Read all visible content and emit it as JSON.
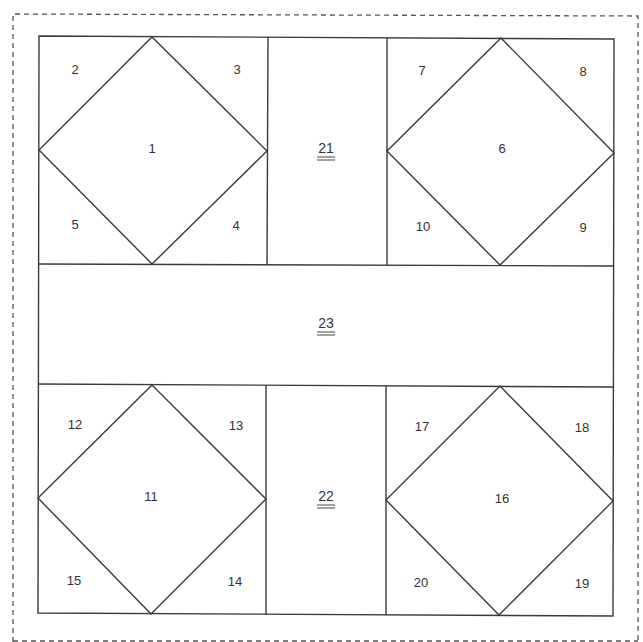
{
  "diagram": {
    "type": "quilt-block-pattern",
    "colors": {
      "line": "#3a3a3a",
      "label": "#333333",
      "dashed_border": "#555555",
      "background": "#ffffff"
    },
    "outer_border_style": "dashed",
    "pieces": [
      {
        "id": "1",
        "label": "1",
        "shape": "diamond",
        "block": "upper-left"
      },
      {
        "id": "2",
        "label": "2",
        "shape": "triangle",
        "block": "upper-left",
        "corner": "top-left"
      },
      {
        "id": "3",
        "label": "3",
        "shape": "triangle",
        "block": "upper-left",
        "corner": "top-right"
      },
      {
        "id": "4",
        "label": "4",
        "shape": "triangle",
        "block": "upper-left",
        "corner": "bottom-right"
      },
      {
        "id": "5",
        "label": "5",
        "shape": "triangle",
        "block": "upper-left",
        "corner": "bottom-left"
      },
      {
        "id": "6",
        "label": "6",
        "shape": "diamond",
        "block": "upper-right"
      },
      {
        "id": "7",
        "label": "7",
        "shape": "triangle",
        "block": "upper-right",
        "corner": "top-left"
      },
      {
        "id": "8",
        "label": "8",
        "shape": "triangle",
        "block": "upper-right",
        "corner": "top-right"
      },
      {
        "id": "9",
        "label": "9",
        "shape": "triangle",
        "block": "upper-right",
        "corner": "bottom-right"
      },
      {
        "id": "10",
        "label": "10",
        "shape": "triangle",
        "block": "upper-right",
        "corner": "bottom-left"
      },
      {
        "id": "11",
        "label": "11",
        "shape": "diamond",
        "block": "lower-left"
      },
      {
        "id": "12",
        "label": "12",
        "shape": "triangle",
        "block": "lower-left",
        "corner": "top-left"
      },
      {
        "id": "13",
        "label": "13",
        "shape": "triangle",
        "block": "lower-left",
        "corner": "top-right"
      },
      {
        "id": "14",
        "label": "14",
        "shape": "triangle",
        "block": "lower-left",
        "corner": "bottom-right"
      },
      {
        "id": "15",
        "label": "15",
        "shape": "triangle",
        "block": "lower-left",
        "corner": "bottom-left"
      },
      {
        "id": "16",
        "label": "16",
        "shape": "diamond",
        "block": "lower-right"
      },
      {
        "id": "17",
        "label": "17",
        "shape": "triangle",
        "block": "lower-right",
        "corner": "top-left"
      },
      {
        "id": "18",
        "label": "18",
        "shape": "triangle",
        "block": "lower-right",
        "corner": "top-right"
      },
      {
        "id": "19",
        "label": "19",
        "shape": "triangle",
        "block": "lower-right",
        "corner": "bottom-right"
      },
      {
        "id": "20",
        "label": "20",
        "shape": "triangle",
        "block": "lower-right",
        "corner": "bottom-left"
      },
      {
        "id": "21",
        "label": "21",
        "shape": "rectangle",
        "position": "upper-center-sashing",
        "underlined": true
      },
      {
        "id": "22",
        "label": "22",
        "shape": "rectangle",
        "position": "lower-center-sashing",
        "underlined": true
      },
      {
        "id": "23",
        "label": "23",
        "shape": "rectangle",
        "position": "middle-horizontal-sashing",
        "underlined": true
      }
    ]
  }
}
